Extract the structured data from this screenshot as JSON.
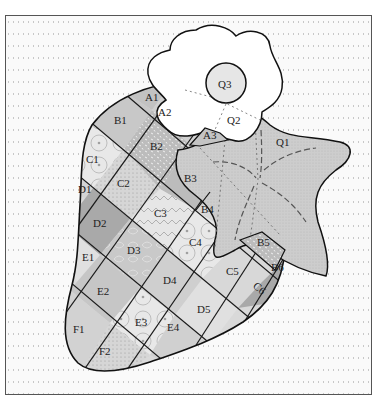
{
  "diagram": {
    "colors": {
      "background": "#fafafa",
      "frame_border": "#555555",
      "outline": "#1a1a1a",
      "flower_fill": "#ffffff",
      "leaf_fill": "#cfcfcf",
      "dark_patch": "#a9a9a9",
      "mid_patch": "#c6c6c6",
      "light_patch": "#e4e4e4"
    },
    "pieces": {
      "A1": "A1",
      "A2": "A2",
      "A3": "A3",
      "B1": "B1",
      "B2": "B2",
      "B3": "B3",
      "B4": "B4",
      "B5": "B5",
      "B6": "B6",
      "C1": "C1",
      "C2": "C2",
      "C3": "C3",
      "C4": "C4",
      "C5": "C5",
      "C6": "C6",
      "D1": "D1",
      "D2": "D2",
      "D3": "D3",
      "D4": "D4",
      "D5": "D5",
      "E1": "E1",
      "E2": "E2",
      "E3": "E3",
      "E4": "E4",
      "F1": "F1",
      "F2": "F2",
      "Q1": "Q1",
      "Q2": "Q2",
      "Q3": "Q3"
    },
    "groups": {
      "berry_body": "Strawberry body (grid of pieced squares A–F)",
      "leaf": "Star-shaped calyx leaf (Q1) with dashed quilting lines",
      "flower": "Flower blossom (Q2) with circular center (Q3)"
    }
  }
}
